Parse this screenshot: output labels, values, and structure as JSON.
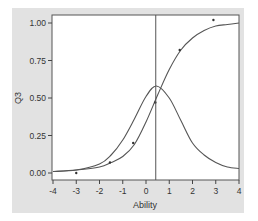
{
  "chart_data": {
    "type": "line",
    "title": "",
    "xlabel": "Ability",
    "ylabel": "Q3",
    "xlim": [
      -4,
      4
    ],
    "ylim": [
      -0.05,
      1.05
    ],
    "x_ticks": [
      "-4",
      "-3",
      "-2",
      "-1",
      "0",
      "1",
      "2",
      "3",
      "4"
    ],
    "y_ticks": [
      "0.00",
      "0.25",
      "0.50",
      "0.75",
      "1.00"
    ],
    "grid": false,
    "legend": null,
    "reference_line": {
      "orientation": "vertical",
      "x": 0.42
    },
    "series": [
      {
        "name": "Item characteristic curve",
        "type": "line",
        "x": [
          -4,
          -3,
          -2,
          -1.5,
          -1,
          -0.5,
          0,
          0.5,
          1,
          1.5,
          2,
          2.5,
          3,
          3.5,
          4
        ],
        "y": [
          0.01,
          0.02,
          0.04,
          0.07,
          0.11,
          0.19,
          0.34,
          0.52,
          0.69,
          0.82,
          0.9,
          0.95,
          0.98,
          0.99,
          1.0
        ]
      },
      {
        "name": "Item information curve",
        "type": "line",
        "x": [
          -4,
          -3,
          -2,
          -1.5,
          -1,
          -0.5,
          0,
          0.45,
          1,
          1.5,
          2,
          2.5,
          3,
          3.5,
          4
        ],
        "y": [
          0.01,
          0.02,
          0.06,
          0.12,
          0.22,
          0.36,
          0.51,
          0.58,
          0.5,
          0.35,
          0.2,
          0.12,
          0.07,
          0.04,
          0.03
        ]
      },
      {
        "name": "Observed proportions",
        "type": "scatter",
        "x": [
          -3.0,
          -1.55,
          -0.55,
          0.4,
          1.45,
          2.9
        ],
        "y": [
          0.0,
          0.07,
          0.2,
          0.47,
          0.82,
          1.02
        ]
      }
    ]
  },
  "axes": {
    "x_title": "Ability",
    "y_title": "Q3",
    "x_tick_labels": [
      "-4",
      "-3",
      "-2",
      "-1",
      "0",
      "1",
      "2",
      "3",
      "4"
    ],
    "y_tick_labels": [
      "0.00",
      "0.25",
      "0.50",
      "0.75",
      "1.00"
    ]
  },
  "colors": {
    "panel_background": "#e2e2e2",
    "plot_background": "#ffffff",
    "line": "#555555",
    "axis": "#444444",
    "text": "#333333"
  }
}
